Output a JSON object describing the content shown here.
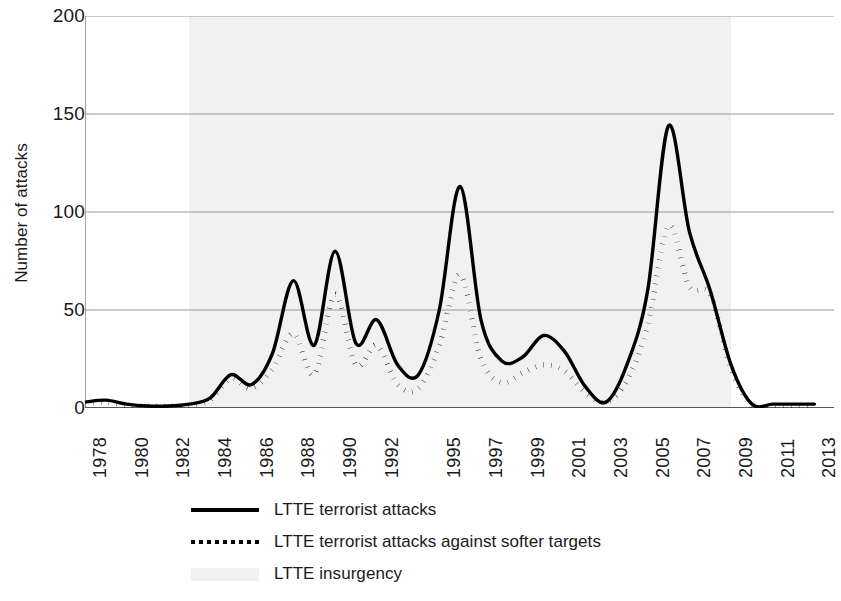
{
  "chart_data": {
    "type": "line",
    "title": "",
    "xlabel": "",
    "ylabel": "Number of attacks",
    "ylim": [
      0,
      200
    ],
    "yticks": [
      0,
      50,
      100,
      150,
      200
    ],
    "ytick_labels": [
      "0",
      "50",
      "100",
      "150",
      "200"
    ],
    "grid": "horizontal",
    "legend_position": "bottom",
    "x": [
      1978,
      1979,
      1980,
      1981,
      1982,
      1983,
      1984,
      1985,
      1986,
      1987,
      1988,
      1989,
      1990,
      1991,
      1992,
      1993,
      1994,
      1995,
      1996,
      1997,
      1998,
      1999,
      2000,
      2001,
      2002,
      2003,
      2004,
      2005,
      2006,
      2007,
      2008,
      2009,
      2010,
      2011,
      2012,
      2013
    ],
    "xtick_labels": [
      "1978",
      "1980",
      "1982",
      "1984",
      "1986",
      "1988",
      "1990",
      "1992",
      "1995",
      "1997",
      "1999",
      "2001",
      "2003",
      "2005",
      "2007",
      "2009",
      "2011",
      "2013"
    ],
    "xtick_values": [
      1978,
      1980,
      1982,
      1984,
      1986,
      1988,
      1990,
      1992,
      1995,
      1997,
      1999,
      2001,
      2003,
      2005,
      2007,
      2009,
      2011,
      2013
    ],
    "series": [
      {
        "name": "LTTE terrorist attacks",
        "style": "solid",
        "color": "#000000",
        "values": [
          3,
          4,
          2,
          1,
          1,
          2,
          5,
          17,
          12,
          28,
          65,
          32,
          80,
          33,
          45,
          22,
          17,
          50,
          113,
          45,
          24,
          26,
          37,
          29,
          11,
          3,
          22,
          60,
          144,
          90,
          60,
          22,
          2,
          2,
          2,
          2
        ]
      },
      {
        "name": "LTTE terrorist attacks against softer targets",
        "style": "dotted",
        "color": "#000000",
        "values": [
          2,
          3,
          1,
          1,
          1,
          1,
          4,
          15,
          10,
          20,
          38,
          17,
          58,
          22,
          32,
          12,
          10,
          32,
          68,
          25,
          13,
          18,
          22,
          19,
          8,
          3,
          14,
          42,
          93,
          62,
          58,
          20,
          1,
          1,
          1,
          1
        ]
      },
      {
        "name": "LTTE insurgency",
        "style": "shaded-band",
        "color": "#f1f1f1",
        "band_start": 1983,
        "band_end": 2009
      }
    ]
  },
  "legend": {
    "items": [
      {
        "label": "LTTE terrorist attacks",
        "marker": "solid-line-marker"
      },
      {
        "label": "LTTE terrorist attacks against softer targets",
        "marker": "dotted-line-marker"
      },
      {
        "label": "LTTE insurgency",
        "marker": "shaded-band-marker"
      }
    ]
  }
}
